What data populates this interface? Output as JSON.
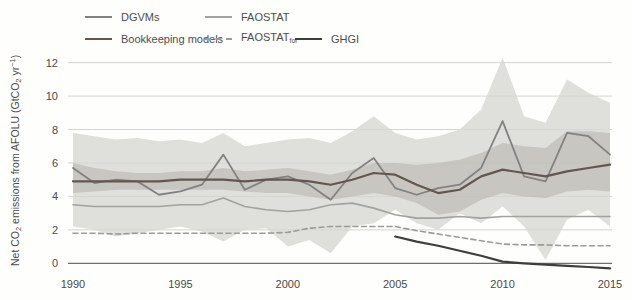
{
  "figure": {
    "ylabel_parts": [
      {
        "text": "Net CO"
      },
      {
        "text": "2",
        "script": "sub"
      },
      {
        "text": " emissions from AFOLU (GtCO"
      },
      {
        "text": "2",
        "script": "sub"
      },
      {
        "text": " yr"
      },
      {
        "text": "−1",
        "script": "sup"
      },
      {
        "text": ")"
      }
    ],
    "legend": [
      {
        "id": "dgvms",
        "label": "DGVMs",
        "color": "#828282",
        "style": "solid",
        "weight": 2,
        "row": 0,
        "col": 0
      },
      {
        "id": "faostat",
        "label": "FAOSTAT",
        "color": "#a2a29e",
        "style": "solid",
        "weight": 2,
        "row": 0,
        "col": 1
      },
      {
        "id": "bookkeeping-models",
        "label": "Bookkeeping models",
        "color": "#625750",
        "style": "solid",
        "weight": 2.5,
        "row": 1,
        "col": 0
      },
      {
        "id": "faostat-for",
        "label": "FAOSTAT",
        "subscript": "for",
        "color": "#9b9b97",
        "style": "dashed",
        "weight": 2,
        "row": 1,
        "col": 1
      },
      {
        "id": "ghgi",
        "label": "GHGI",
        "color": "#3f3e3c",
        "style": "solid",
        "weight": 2.5,
        "row": 1,
        "col": 2
      }
    ]
  },
  "chart_data": {
    "type": "line",
    "title": "",
    "xlabel": "",
    "ylabel": "Net CO2 emissions from AFOLU (GtCO2 yr-1)",
    "xlim": [
      1990,
      2015
    ],
    "ylim": [
      -0.5,
      12.4
    ],
    "xticks": [
      1990,
      1995,
      2000,
      2005,
      2010,
      2015
    ],
    "yticks": [
      0,
      2,
      4,
      6,
      8,
      10,
      12
    ],
    "grid": "horizontal",
    "legend_position": "top-left",
    "x": [
      1990,
      1991,
      1992,
      1993,
      1994,
      1995,
      1996,
      1997,
      1998,
      1999,
      2000,
      2001,
      2002,
      2003,
      2004,
      2005,
      2006,
      2007,
      2008,
      2009,
      2010,
      2011,
      2012,
      2013,
      2014,
      2015
    ],
    "bands": [
      {
        "name": "DGVMs range",
        "color": "#d7d7d2",
        "opacity": 0.8,
        "lower": [
          2.2,
          2.0,
          1.6,
          1.8,
          2.0,
          2.2,
          1.9,
          1.3,
          2.0,
          2.1,
          1.0,
          1.4,
          0.6,
          2.2,
          2.4,
          3.2,
          2.4,
          2.0,
          3.0,
          2.4,
          3.4,
          2.2,
          0.2,
          2.6,
          3.2,
          2.2
        ],
        "upper": [
          7.8,
          7.6,
          7.4,
          7.5,
          7.3,
          7.4,
          7.2,
          7.8,
          7.0,
          7.2,
          7.4,
          7.5,
          7.2,
          7.9,
          8.8,
          7.8,
          7.4,
          7.6,
          8.0,
          9.2,
          12.3,
          8.8,
          8.4,
          11.0,
          10.2,
          9.6
        ]
      },
      {
        "name": "Bookkeeping models range",
        "color": "#b2b0aa",
        "opacity": 0.55,
        "lower": [
          4.2,
          4.3,
          4.4,
          4.4,
          4.4,
          4.4,
          4.4,
          4.4,
          4.3,
          4.2,
          4.2,
          4.0,
          3.8,
          4.0,
          4.2,
          4.0,
          3.6,
          2.9,
          3.1,
          3.8,
          4.2,
          4.0,
          3.9,
          4.3,
          4.4,
          4.3
        ],
        "upper": [
          6.0,
          5.7,
          5.5,
          5.4,
          5.4,
          5.5,
          5.5,
          5.7,
          5.5,
          5.6,
          5.7,
          5.5,
          5.3,
          5.6,
          6.0,
          6.0,
          5.9,
          6.0,
          6.2,
          6.6,
          7.2,
          7.0,
          6.9,
          7.9,
          7.9,
          7.8
        ]
      }
    ],
    "series": [
      {
        "name": "FAOSTAT",
        "color": "#a2a29e",
        "width": 1.6,
        "values": [
          3.5,
          3.4,
          3.4,
          3.4,
          3.4,
          3.5,
          3.5,
          3.9,
          3.4,
          3.2,
          3.1,
          3.2,
          3.5,
          3.6,
          3.3,
          2.9,
          2.7,
          2.7,
          2.8,
          2.7,
          2.8,
          2.8,
          2.8,
          2.8,
          2.8,
          2.8
        ]
      },
      {
        "name": "FAOSTAT_for",
        "color": "#9b9b97",
        "width": 1.6,
        "dash": "5,3.5",
        "values": [
          1.8,
          1.8,
          1.75,
          1.8,
          1.8,
          1.8,
          1.8,
          1.8,
          1.8,
          1.8,
          1.85,
          2.1,
          2.2,
          2.2,
          2.2,
          2.2,
          1.95,
          1.75,
          1.55,
          1.35,
          1.15,
          1.1,
          1.1,
          1.05,
          1.05,
          1.05
        ]
      },
      {
        "name": "DGVMs",
        "color": "#828282",
        "width": 1.8,
        "values": [
          5.7,
          4.8,
          5.0,
          4.9,
          4.1,
          4.3,
          4.7,
          6.5,
          4.4,
          5.0,
          5.2,
          4.7,
          3.8,
          5.4,
          6.3,
          4.5,
          4.1,
          4.5,
          4.7,
          5.7,
          8.5,
          5.2,
          4.9,
          7.8,
          7.6,
          6.5
        ]
      },
      {
        "name": "Bookkeeping models",
        "color": "#625750",
        "width": 2.2,
        "values": [
          4.9,
          4.9,
          4.9,
          4.9,
          4.9,
          5.0,
          5.0,
          5.0,
          4.9,
          5.0,
          5.0,
          4.9,
          4.7,
          5.0,
          5.4,
          5.3,
          4.7,
          4.2,
          4.4,
          5.2,
          5.6,
          5.4,
          5.2,
          5.5,
          5.7,
          5.9
        ]
      },
      {
        "name": "GHGI",
        "color": "#3f3e3c",
        "width": 2.2,
        "x": [
          2005,
          2006,
          2007,
          2008,
          2009,
          2010,
          2011,
          2012,
          2013,
          2014,
          2015
        ],
        "values": [
          1.6,
          1.3,
          1.05,
          0.75,
          0.45,
          0.1,
          0.0,
          -0.08,
          -0.15,
          -0.22,
          -0.3
        ]
      }
    ]
  }
}
